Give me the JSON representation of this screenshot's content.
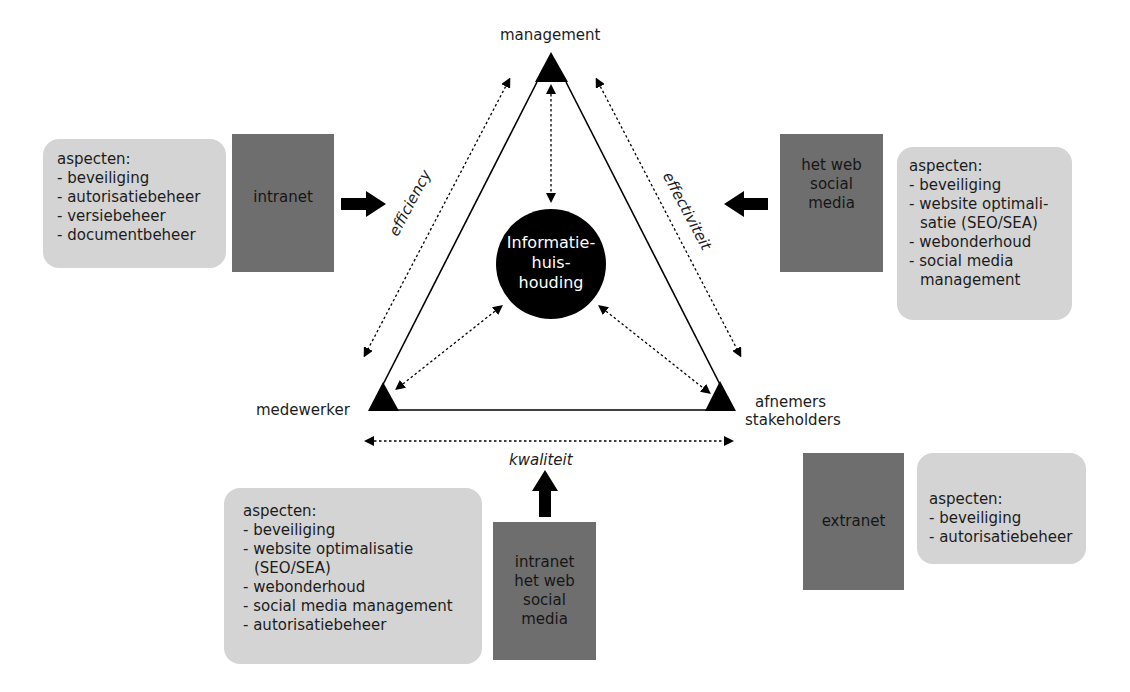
{
  "nodes": {
    "top": "management",
    "bottom_left": "medewerker",
    "bottom_right_line1": "afnemers",
    "bottom_right_line2": "stakeholders",
    "center": [
      "Informatie-",
      "huis-",
      "houding"
    ]
  },
  "edges": {
    "left": "efficiency",
    "right": "effectiviteit",
    "bottom": "kwaliteit"
  },
  "channels": {
    "left": {
      "label": [
        "intranet"
      ],
      "aspects_title": "aspecten:",
      "aspects": [
        "- beveiliging",
        "- autorisatiebeheer",
        "- versiebeheer",
        "- documentbeheer"
      ]
    },
    "right": {
      "label": [
        "het web",
        "social",
        "media"
      ],
      "aspects_title": "aspecten:",
      "aspects": [
        "- beveiliging",
        "- website optimali-",
        "satie (SEO/SEA)",
        "- webonderhoud",
        "- social media",
        "management"
      ]
    },
    "bottom": {
      "label": [
        "intranet",
        "het web",
        "social",
        "media"
      ],
      "aspects_title": "aspecten:",
      "aspects": [
        "- beveiliging",
        "- website optimalisatie",
        "(SEO/SEA)",
        "- webonderhoud",
        "- social media management",
        "- autorisatiebeheer"
      ]
    },
    "extranet": {
      "label": [
        "extranet"
      ],
      "aspects_title": "aspecten:",
      "aspects": [
        "- beveiliging",
        "- autorisatiebeheer"
      ]
    }
  },
  "colors": {
    "light_box": "#d4d4d4",
    "dark_box": "#6e6e6e",
    "ink": "#000000"
  }
}
